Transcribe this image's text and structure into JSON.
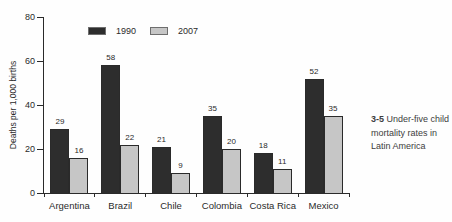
{
  "figure": {
    "caption": {
      "number": "3-5",
      "text": "Under-five child mortality rates in Latin America"
    }
  },
  "chart_data": {
    "type": "bar",
    "title": "",
    "xlabel": "",
    "ylabel": "Deaths per 1,000 births",
    "ylim": [
      0,
      80
    ],
    "yticks": [
      0,
      20,
      40,
      60,
      80
    ],
    "grid": false,
    "legend_position": "top",
    "value_labels": true,
    "categories": [
      "Argentina",
      "Brazil",
      "Chile",
      "Colombia",
      "Costa Rica",
      "Mexico"
    ],
    "series": [
      {
        "name": "1990",
        "color": "#2d2d2d",
        "values": [
          29,
          58,
          21,
          35,
          18,
          52
        ]
      },
      {
        "name": "2007",
        "color": "#c6c6c6",
        "values": [
          16,
          22,
          9,
          20,
          11,
          35
        ]
      }
    ],
    "colors": {
      "axis": "#2a2a2a",
      "text": "#2a2a2a",
      "bar_border": "#2a2a2a",
      "background": "#fefefe",
      "caption_text": "#3d3d3d"
    }
  }
}
